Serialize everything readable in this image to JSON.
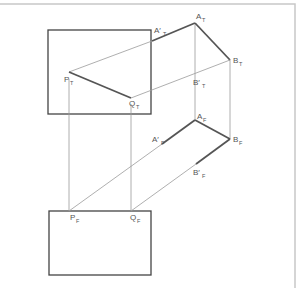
{
  "diagram": {
    "type": "orthographic-projection",
    "views": [
      "top",
      "front"
    ],
    "colors": {
      "line": "#555555",
      "projection": "#9a9a9a",
      "frame": "#c8c8c8"
    },
    "labels": {
      "A_T": {
        "main": "A",
        "prime": "",
        "sub": "T"
      },
      "A1_T": {
        "main": "A",
        "prime": "′",
        "sub": "T"
      },
      "B_T": {
        "main": "B",
        "prime": "",
        "sub": "T"
      },
      "B1_T": {
        "main": "B",
        "prime": "′",
        "sub": "T"
      },
      "P_T": {
        "main": "P",
        "prime": "",
        "sub": "T"
      },
      "Q_T": {
        "main": "Q",
        "prime": "",
        "sub": "T"
      },
      "A_F": {
        "main": "A",
        "prime": "",
        "sub": "F"
      },
      "A1_F": {
        "main": "A",
        "prime": "′",
        "sub": "F"
      },
      "B_F": {
        "main": "B",
        "prime": "",
        "sub": "F"
      },
      "B1_F": {
        "main": "B",
        "prime": "′",
        "sub": "F"
      },
      "P_F": {
        "main": "P",
        "prime": "",
        "sub": "F"
      },
      "Q_F": {
        "main": "Q",
        "prime": "",
        "sub": "F"
      }
    }
  }
}
